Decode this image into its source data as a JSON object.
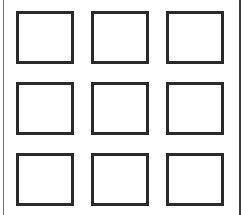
{
  "grid": {
    "rows": 3,
    "columns": 3,
    "cells": [
      {
        "row": 1,
        "col": 1
      },
      {
        "row": 1,
        "col": 2
      },
      {
        "row": 1,
        "col": 3
      },
      {
        "row": 2,
        "col": 1
      },
      {
        "row": 2,
        "col": 2
      },
      {
        "row": 2,
        "col": 3
      },
      {
        "row": 3,
        "col": 1
      },
      {
        "row": 3,
        "col": 2
      },
      {
        "row": 3,
        "col": 3
      }
    ]
  },
  "colors": {
    "background": "#ffffff",
    "cell_border": "#2a2a2a",
    "frame_left": "#6e6e6e",
    "frame_right": "#3a3a3a"
  }
}
